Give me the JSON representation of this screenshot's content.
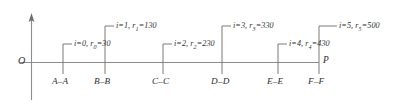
{
  "figure": {
    "type": "technical-axis-diagram",
    "origin_label": "O",
    "end_point_label": "P",
    "colors": {
      "axis": "#8d8d8d",
      "tick": "#6b6b6b",
      "text": "#2e2e2e",
      "background": "#ffffff"
    },
    "axis": {
      "vertical_x": 31,
      "horizontal_y": 62,
      "horizontal_start_x": 31,
      "horizontal_end_x": 319,
      "vertical_top_y": 14,
      "vertical_bottom_y": 100
    },
    "stations": [
      {
        "index": "0",
        "section_label": "A–A",
        "callout_i": "i=0",
        "callout_r": "r",
        "callout_r_sub": "0",
        "callout_value": "=30",
        "r_value": 30,
        "tick_x": 63,
        "callout_row": "lower"
      },
      {
        "index": "1",
        "section_label": "B–B",
        "callout_i": "i=1",
        "callout_r": "r",
        "callout_r_sub": "1",
        "callout_value": "=130",
        "r_value": 130,
        "tick_x": 105,
        "callout_row": "upper"
      },
      {
        "index": "2",
        "section_label": "C–C",
        "callout_i": "i=2",
        "callout_r": "r",
        "callout_r_sub": "2",
        "callout_value": "=230",
        "r_value": 230,
        "tick_x": 163,
        "callout_row": "lower"
      },
      {
        "index": "3",
        "section_label": "D–D",
        "callout_i": "i=3",
        "callout_r": "r",
        "callout_r_sub": "3",
        "callout_value": "=330",
        "r_value": 330,
        "tick_x": 222,
        "callout_row": "upper"
      },
      {
        "index": "4",
        "section_label": "E–E",
        "callout_i": "i=4",
        "callout_r": "r",
        "callout_r_sub": "4",
        "callout_value": "=430",
        "r_value": 430,
        "tick_x": 278,
        "callout_row": "lower"
      },
      {
        "index": "5",
        "section_label": "F–F",
        "callout_i": "i=5",
        "callout_r": "r",
        "callout_r_sub": "5",
        "callout_value": "=500",
        "r_value": 500,
        "tick_x": 319,
        "callout_row": "upper"
      }
    ]
  }
}
